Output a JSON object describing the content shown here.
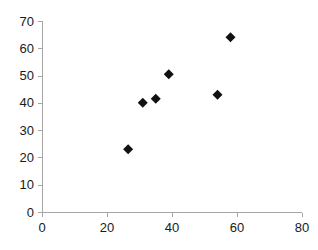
{
  "chart_data": {
    "type": "scatter",
    "title": "",
    "subtitle": "",
    "xlabel": "",
    "ylabel": "",
    "xlim": [
      0,
      80
    ],
    "ylim": [
      0,
      70
    ],
    "xticks": [
      0,
      20,
      40,
      60,
      80
    ],
    "yticks": [
      0,
      10,
      20,
      30,
      40,
      50,
      60,
      70
    ],
    "xtick_labels": [
      "0",
      "20",
      "40",
      "60",
      "80"
    ],
    "ytick_labels": [
      "0",
      "10",
      "20",
      "30",
      "40",
      "50",
      "60",
      "70"
    ],
    "grid": false,
    "legend": null,
    "legend_position": "none",
    "marker": "diamond",
    "marker_color": "#111111",
    "axis_color": "#a6a6a6",
    "background_color": "#ffffff",
    "series": [
      {
        "name": "Series 1",
        "points": [
          {
            "x": 26.5,
            "y": 23
          },
          {
            "x": 31,
            "y": 40
          },
          {
            "x": 35,
            "y": 41.5
          },
          {
            "x": 39,
            "y": 50.5
          },
          {
            "x": 54,
            "y": 43
          },
          {
            "x": 58,
            "y": 64
          }
        ]
      }
    ]
  }
}
